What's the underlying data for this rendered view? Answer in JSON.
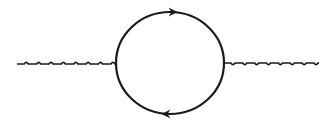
{
  "diagram": {
    "type": "feynman-diagram",
    "colors": {
      "background": "#ffffff",
      "stroke": "#1a1a1a"
    },
    "loop": {
      "cx": 170,
      "cy": 63,
      "rx": 54,
      "ry": 51,
      "stroke_width": 2.2,
      "arrows": [
        {
          "position": "top",
          "x": 173,
          "y": 12,
          "direction": "right"
        },
        {
          "position": "bottom",
          "x": 166,
          "y": 114,
          "direction": "left"
        }
      ]
    },
    "external_lines": [
      {
        "name": "incoming-boson",
        "style": "wavy",
        "x1": 17,
        "x2": 116,
        "y": 64,
        "bump_direction": "up",
        "bumps": 8
      },
      {
        "name": "outgoing-boson",
        "style": "wavy",
        "x1": 224,
        "x2": 319,
        "y": 63,
        "bump_direction": "down",
        "bumps": 8
      }
    ]
  }
}
